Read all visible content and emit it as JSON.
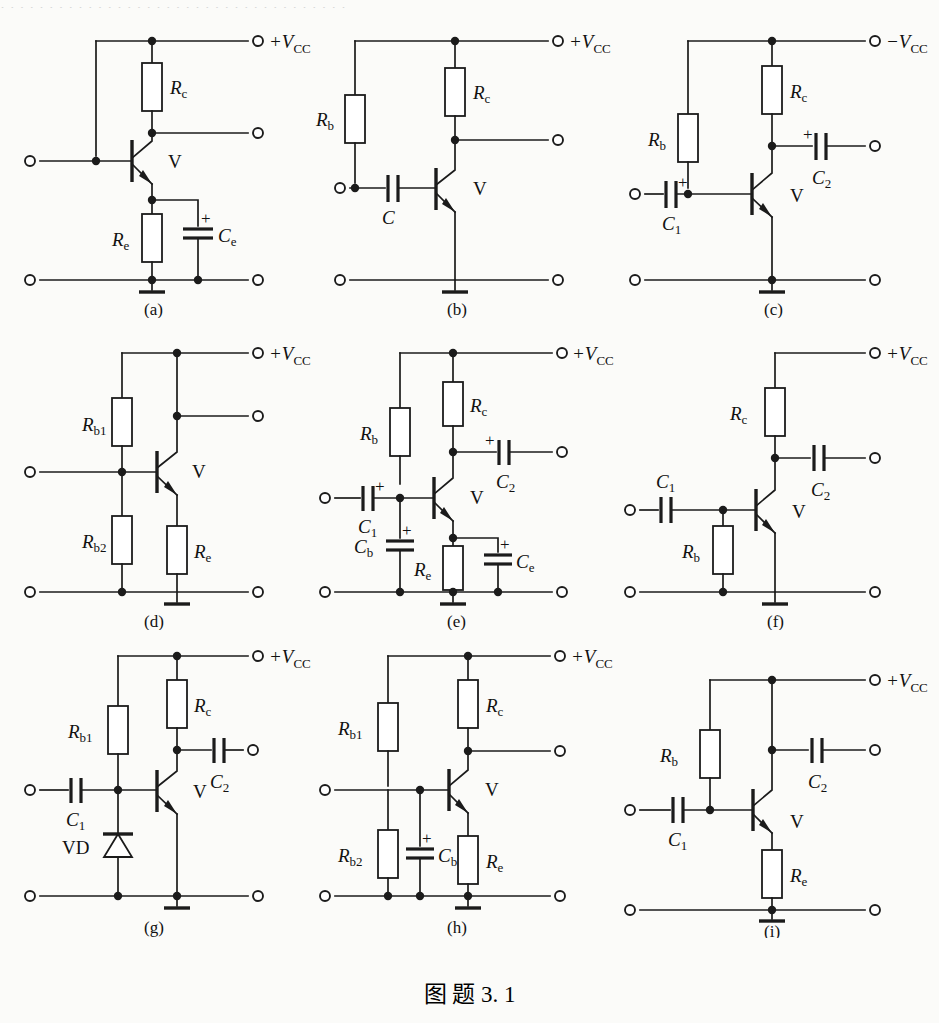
{
  "figure": {
    "caption": "图  题 3. 1",
    "top_cut_text": "· · · · · · · · · · · · · · · · · · · · · · · · · · · · · · · · · · · ·",
    "ink_color": "#1b1b1b",
    "paper_color": "#fbfbf9"
  },
  "panels": [
    {
      "id": "a",
      "subcaption": "(a)",
      "supply_label": "+V",
      "supply_sub": "CC",
      "transistor_label": "V",
      "components": [
        {
          "name": "Rc",
          "base": "R",
          "sub": "c",
          "type": "resistor"
        },
        {
          "name": "Re",
          "base": "R",
          "sub": "e",
          "type": "resistor"
        },
        {
          "name": "Ce",
          "base": "C",
          "sub": "e",
          "type": "capacitor-polarized",
          "polarity": "+"
        }
      ]
    },
    {
      "id": "b",
      "subcaption": "(b)",
      "supply_label": "+V",
      "supply_sub": "CC",
      "transistor_label": "V",
      "components": [
        {
          "name": "Rb",
          "base": "R",
          "sub": "b",
          "type": "resistor"
        },
        {
          "name": "Rc",
          "base": "R",
          "sub": "c",
          "type": "resistor"
        },
        {
          "name": "C",
          "base": "C",
          "sub": "",
          "type": "capacitor"
        }
      ]
    },
    {
      "id": "c",
      "subcaption": "(c)",
      "supply_label": "−V",
      "supply_sub": "CC",
      "transistor_label": "V",
      "components": [
        {
          "name": "Rb",
          "base": "R",
          "sub": "b",
          "type": "resistor"
        },
        {
          "name": "Rc",
          "base": "R",
          "sub": "c",
          "type": "resistor"
        },
        {
          "name": "C1",
          "base": "C",
          "sub": "1",
          "type": "capacitor-polarized",
          "polarity": "+"
        },
        {
          "name": "C2",
          "base": "C",
          "sub": "2",
          "type": "capacitor-polarized",
          "polarity": "+"
        }
      ]
    },
    {
      "id": "d",
      "subcaption": "(d)",
      "supply_label": "+V",
      "supply_sub": "CC",
      "transistor_label": "V",
      "components": [
        {
          "name": "Rb1",
          "base": "R",
          "sub": "b1",
          "type": "resistor"
        },
        {
          "name": "Rb2",
          "base": "R",
          "sub": "b2",
          "type": "resistor"
        },
        {
          "name": "Re",
          "base": "R",
          "sub": "e",
          "type": "resistor"
        }
      ]
    },
    {
      "id": "e",
      "subcaption": "(e)",
      "supply_label": "+V",
      "supply_sub": "CC",
      "transistor_label": "V",
      "components": [
        {
          "name": "Rb",
          "base": "R",
          "sub": "b",
          "type": "resistor"
        },
        {
          "name": "Rc",
          "base": "R",
          "sub": "c",
          "type": "resistor"
        },
        {
          "name": "Re",
          "base": "R",
          "sub": "e",
          "type": "resistor"
        },
        {
          "name": "C1",
          "base": "C",
          "sub": "1",
          "type": "capacitor-polarized",
          "polarity": "+"
        },
        {
          "name": "C2",
          "base": "C",
          "sub": "2",
          "type": "capacitor-polarized",
          "polarity": "+"
        },
        {
          "name": "Cb",
          "base": "C",
          "sub": "b",
          "type": "capacitor-polarized",
          "polarity": "+"
        },
        {
          "name": "Ce",
          "base": "C",
          "sub": "e",
          "type": "capacitor-polarized",
          "polarity": "+"
        }
      ]
    },
    {
      "id": "f",
      "subcaption": "(f)",
      "supply_label": "+V",
      "supply_sub": "CC",
      "transistor_label": "V",
      "components": [
        {
          "name": "Rc",
          "base": "R",
          "sub": "c",
          "type": "resistor"
        },
        {
          "name": "Rb",
          "base": "R",
          "sub": "b",
          "type": "resistor"
        },
        {
          "name": "C1",
          "base": "C",
          "sub": "1",
          "type": "capacitor"
        },
        {
          "name": "C2",
          "base": "C",
          "sub": "2",
          "type": "capacitor"
        }
      ]
    },
    {
      "id": "g",
      "subcaption": "(g)",
      "supply_label": "+V",
      "supply_sub": "CC",
      "transistor_label": "V",
      "components": [
        {
          "name": "Rb1",
          "base": "R",
          "sub": "b1",
          "type": "resistor"
        },
        {
          "name": "Rc",
          "base": "R",
          "sub": "c",
          "type": "resistor"
        },
        {
          "name": "C1",
          "base": "C",
          "sub": "1",
          "type": "capacitor"
        },
        {
          "name": "C2",
          "base": "C",
          "sub": "2",
          "type": "capacitor"
        },
        {
          "name": "VD",
          "base": "VD",
          "sub": "",
          "type": "diode"
        }
      ]
    },
    {
      "id": "h",
      "subcaption": "(h)",
      "supply_label": "+V",
      "supply_sub": "CC",
      "transistor_label": "V",
      "components": [
        {
          "name": "Rb1",
          "base": "R",
          "sub": "b1",
          "type": "resistor"
        },
        {
          "name": "Rb2",
          "base": "R",
          "sub": "b2",
          "type": "resistor"
        },
        {
          "name": "Rc",
          "base": "R",
          "sub": "c",
          "type": "resistor"
        },
        {
          "name": "Re",
          "base": "R",
          "sub": "e",
          "type": "resistor"
        },
        {
          "name": "Cb",
          "base": "C",
          "sub": "b",
          "type": "capacitor-polarized",
          "polarity": "+"
        }
      ]
    },
    {
      "id": "i",
      "subcaption": "(i)",
      "supply_label": "+V",
      "supply_sub": "CC",
      "transistor_label": "V",
      "components": [
        {
          "name": "Rb",
          "base": "R",
          "sub": "b",
          "type": "resistor"
        },
        {
          "name": "Rc",
          "base": "R",
          "sub": "c",
          "type": "resistor"
        },
        {
          "name": "Re",
          "base": "R",
          "sub": "e",
          "type": "resistor"
        },
        {
          "name": "C1",
          "base": "C",
          "sub": "1",
          "type": "capacitor"
        },
        {
          "name": "C2",
          "base": "C",
          "sub": "2",
          "type": "capacitor"
        }
      ]
    }
  ]
}
